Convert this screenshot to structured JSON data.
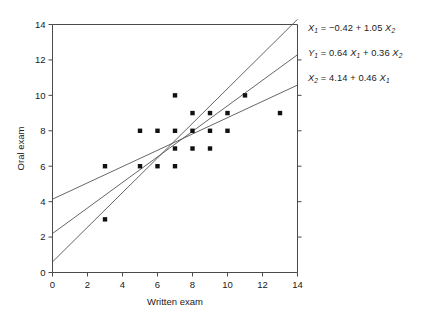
{
  "chart_data": {
    "type": "scatter",
    "title": "",
    "xlabel": "Written exam",
    "ylabel": "Oral exam",
    "xlim": [
      0,
      14
    ],
    "ylim": [
      0,
      14
    ],
    "xticks": [
      0,
      2,
      4,
      6,
      8,
      10,
      12,
      14
    ],
    "yticks": [
      0,
      2,
      4,
      6,
      8,
      10,
      12,
      14
    ],
    "grid": false,
    "legend": "none",
    "points": [
      {
        "x": 3,
        "y": 6
      },
      {
        "x": 3,
        "y": 3
      },
      {
        "x": 5,
        "y": 8
      },
      {
        "x": 5,
        "y": 6
      },
      {
        "x": 6,
        "y": 8
      },
      {
        "x": 6,
        "y": 6
      },
      {
        "x": 7,
        "y": 10
      },
      {
        "x": 7,
        "y": 8
      },
      {
        "x": 7,
        "y": 7
      },
      {
        "x": 7,
        "y": 6
      },
      {
        "x": 8,
        "y": 9
      },
      {
        "x": 8,
        "y": 8
      },
      {
        "x": 8,
        "y": 7
      },
      {
        "x": 9,
        "y": 9
      },
      {
        "x": 9,
        "y": 8
      },
      {
        "x": 9,
        "y": 7
      },
      {
        "x": 10,
        "y": 9
      },
      {
        "x": 10,
        "y": 8
      },
      {
        "x": 11,
        "y": 10
      },
      {
        "x": 13,
        "y": 9
      }
    ],
    "lines": [
      {
        "name": "X1 on X2",
        "intercept": 0.6,
        "slope": 0.978,
        "x_from": 0,
        "x_to": 14
      },
      {
        "name": "Y1 joint",
        "intercept": 2.2,
        "slope": 0.721,
        "x_from": 0,
        "x_to": 14
      },
      {
        "name": "X2 on X1",
        "intercept": 4.14,
        "slope": 0.46,
        "x_from": 0,
        "x_to": 14
      }
    ],
    "annotations": [
      {
        "id": "eq-x1",
        "text": "X1 = −0.42 + 1.05 X2",
        "parts": [
          {
            "t": "X",
            "style": "italic"
          },
          {
            "t": "1",
            "style": "sub"
          },
          {
            "t": " = −0.42 + 1.05 ",
            "style": "plain"
          },
          {
            "t": "X",
            "style": "italic"
          },
          {
            "t": "2",
            "style": "sub"
          }
        ]
      },
      {
        "id": "eq-y1",
        "text": "Y1 = 0.64 X1 + 0.36 X2",
        "parts": [
          {
            "t": "Y",
            "style": "italic"
          },
          {
            "t": "1",
            "style": "sub"
          },
          {
            "t": " = 0.64 ",
            "style": "plain"
          },
          {
            "t": "X",
            "style": "italic"
          },
          {
            "t": "1",
            "style": "sub"
          },
          {
            "t": " + 0.36 ",
            "style": "plain"
          },
          {
            "t": "X",
            "style": "italic"
          },
          {
            "t": "2",
            "style": "sub"
          }
        ]
      },
      {
        "id": "eq-x2",
        "text": "X2 = 4.14 + 0.46 X1",
        "parts": [
          {
            "t": "X",
            "style": "italic"
          },
          {
            "t": "2",
            "style": "sub"
          },
          {
            "t": " = 4.14 + 0.46 ",
            "style": "plain"
          },
          {
            "t": "X",
            "style": "italic"
          },
          {
            "t": "1",
            "style": "sub"
          }
        ]
      }
    ],
    "colors": {
      "marker": "#111111",
      "line": "#555555",
      "axis": "#4a4a4a",
      "text": "#1a1a1a",
      "background": "#ffffff"
    }
  },
  "axes": {
    "x_label": "Written exam",
    "y_label": "Oral exam",
    "x_tick_labels": [
      "0",
      "2",
      "4",
      "6",
      "8",
      "10",
      "12",
      "14"
    ],
    "y_tick_labels": [
      "0",
      "2",
      "4",
      "6",
      "8",
      "10",
      "12",
      "14"
    ]
  }
}
